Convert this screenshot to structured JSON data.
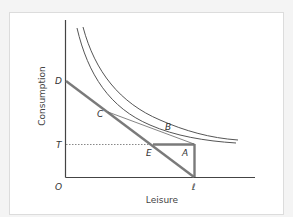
{
  "diagram": {
    "type": "labour-leisure indifference diagram",
    "axes": {
      "y_label": "Consumption",
      "x_label": "Leisure",
      "origin_label": "O"
    },
    "points": {
      "D": "D",
      "C": "C",
      "B": "B",
      "T": "T",
      "E": "E",
      "A": "A",
      "L": "ℓ"
    },
    "colors": {
      "budget_line": "#7a7a7a",
      "indifference_curves": "#555555",
      "axes": "#444444",
      "dotted": "#888888"
    }
  }
}
